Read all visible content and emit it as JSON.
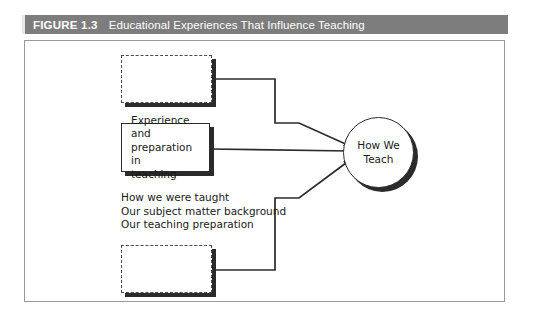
{
  "figure": {
    "number_label": "FIGURE 1.3",
    "title": "Educational Experiences That Influence Teaching",
    "header_bg": "#7d7d7d",
    "header_text_color": "#ffffff",
    "frame_border_color": "#9a9a9a",
    "canvas_bg": "#ffffff"
  },
  "diagram": {
    "type": "flow",
    "nodes": [
      {
        "id": "box-top",
        "label": "",
        "style": "dashed",
        "shadow": true,
        "x": 121,
        "y": 55,
        "w": 91,
        "h": 48
      },
      {
        "id": "box-middle",
        "label": "Experience and preparation in teaching",
        "line1": "Experience and",
        "line2": "preparation in",
        "line3": "teaching",
        "style": "solid",
        "shadow": true,
        "x": 121,
        "y": 123,
        "w": 89,
        "h": 49
      },
      {
        "id": "box-bottom",
        "label": "",
        "style": "dashed",
        "shadow": true,
        "x": 121,
        "y": 245,
        "w": 91,
        "h": 48
      },
      {
        "id": "circle",
        "line1": "How We",
        "line2": "Teach",
        "style": "circle",
        "shadow": true,
        "x": 343,
        "y": 117,
        "w": 71,
        "h": 71
      }
    ],
    "detail_list": [
      "How we were taught",
      "Our subject matter background",
      "Our teaching preparation"
    ],
    "connectors": [
      {
        "from": "box-top",
        "to": "circle",
        "path": "M212,79 L275,79 L275,123 L298,123 L352,146",
        "arrow": true
      },
      {
        "from": "box-middle",
        "to": "circle",
        "path": "M210,148 L352,151",
        "arrow": true
      },
      {
        "from": "box-bottom",
        "to": "circle",
        "path": "M212,269 L275,269 L275,198 L298,198 L352,160",
        "arrow": true
      }
    ],
    "line_color": "#2b2b2b"
  }
}
